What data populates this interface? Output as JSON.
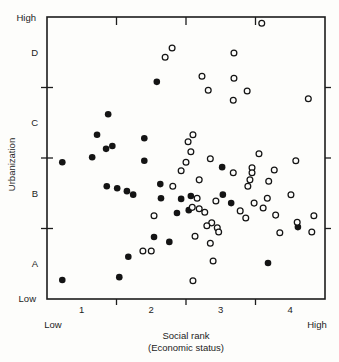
{
  "figure": {
    "background": "#fdfdfb",
    "ink": "#1c1c1c",
    "dot_color": "#141414"
  },
  "chart_data": {
    "type": "scatter",
    "title": "",
    "xlabel_line1": "Social rank",
    "xlabel_line2": "(Economic status)",
    "ylabel": "Urbanization",
    "grid": false,
    "legend": null,
    "x_axis": {
      "range": [
        0,
        4
      ],
      "boundary_ticks": [
        1,
        2,
        3
      ],
      "band_labels": [
        {
          "label": "1",
          "pos": 0.5
        },
        {
          "label": "2",
          "pos": 1.5
        },
        {
          "label": "3",
          "pos": 2.5
        },
        {
          "label": "4",
          "pos": 3.5
        }
      ],
      "low_label": "Low",
      "high_label": "High"
    },
    "y_axis": {
      "range": [
        0,
        4
      ],
      "boundary_ticks": [
        1,
        2,
        3
      ],
      "band_labels": [
        {
          "label": "A",
          "pos": 0.5
        },
        {
          "label": "B",
          "pos": 1.5
        },
        {
          "label": "C",
          "pos": 2.5
        },
        {
          "label": "D",
          "pos": 3.5
        }
      ],
      "low_label": "Low",
      "high_label": "High"
    },
    "series": [
      {
        "name": "filled-circles",
        "marker": "filled-circle",
        "points": [
          [
            1.58,
            3.08
          ],
          [
            0.88,
            2.62
          ],
          [
            0.72,
            2.33
          ],
          [
            1.4,
            2.28
          ],
          [
            0.94,
            2.17
          ],
          [
            0.85,
            2.13
          ],
          [
            0.65,
            2.01
          ],
          [
            0.22,
            1.94
          ],
          [
            1.4,
            1.96
          ],
          [
            2.52,
            1.87
          ],
          [
            1.63,
            1.63
          ],
          [
            0.86,
            1.6
          ],
          [
            1.01,
            1.57
          ],
          [
            1.15,
            1.53
          ],
          [
            1.24,
            1.48
          ],
          [
            2.07,
            1.46
          ],
          [
            1.64,
            1.43
          ],
          [
            1.93,
            1.42
          ],
          [
            2.53,
            1.48
          ],
          [
            2.65,
            1.36
          ],
          [
            2.04,
            1.26
          ],
          [
            1.87,
            1.22
          ],
          [
            1.54,
            0.88
          ],
          [
            1.76,
            0.81
          ],
          [
            1.17,
            0.6
          ],
          [
            3.18,
            0.51
          ],
          [
            1.04,
            0.31
          ],
          [
            0.22,
            0.27
          ],
          [
            3.61,
            1.02
          ]
        ]
      },
      {
        "name": "open-circles",
        "marker": "open-circle",
        "points": [
          [
            3.09,
            3.91
          ],
          [
            1.8,
            3.56
          ],
          [
            1.7,
            3.43
          ],
          [
            2.69,
            3.49
          ],
          [
            2.23,
            3.16
          ],
          [
            2.69,
            3.13
          ],
          [
            2.32,
            2.96
          ],
          [
            2.68,
            2.82
          ],
          [
            2.88,
            2.95
          ],
          [
            3.76,
            2.84
          ],
          [
            2.1,
            2.33
          ],
          [
            2.03,
            2.23
          ],
          [
            2.07,
            2.09
          ],
          [
            2.0,
            1.94
          ],
          [
            1.93,
            1.82
          ],
          [
            2.35,
            1.99
          ],
          [
            2.19,
            1.69
          ],
          [
            1.81,
            1.6
          ],
          [
            2.16,
            1.43
          ],
          [
            2.43,
            1.39
          ],
          [
            2.68,
            1.79
          ],
          [
            3.05,
            2.06
          ],
          [
            3.58,
            1.96
          ],
          [
            2.95,
            1.86
          ],
          [
            2.95,
            1.79
          ],
          [
            2.92,
            1.69
          ],
          [
            2.89,
            1.6
          ],
          [
            3.27,
            1.83
          ],
          [
            3.19,
            1.67
          ],
          [
            3.17,
            1.43
          ],
          [
            3.51,
            1.48
          ],
          [
            2.98,
            1.36
          ],
          [
            3.11,
            1.29
          ],
          [
            2.09,
            1.3
          ],
          [
            2.19,
            1.28
          ],
          [
            2.27,
            1.23
          ],
          [
            1.54,
            1.18
          ],
          [
            2.78,
            1.25
          ],
          [
            2.86,
            1.15
          ],
          [
            3.29,
            1.19
          ],
          [
            3.84,
            1.18
          ],
          [
            2.37,
            1.08
          ],
          [
            2.3,
            1.04
          ],
          [
            2.45,
            1.01
          ],
          [
            2.47,
            0.95
          ],
          [
            2.13,
            0.89
          ],
          [
            2.35,
            0.79
          ],
          [
            1.38,
            0.68
          ],
          [
            1.5,
            0.68
          ],
          [
            2.39,
            0.54
          ],
          [
            2.1,
            0.26
          ],
          [
            3.35,
            0.94
          ],
          [
            3.6,
            1.09
          ],
          [
            3.81,
            0.95
          ]
        ]
      }
    ],
    "layout": {
      "plot_left": 47,
      "plot_top": 17,
      "plot_right": 325,
      "plot_bottom": 299
    }
  }
}
